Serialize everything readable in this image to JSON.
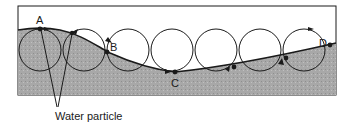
{
  "diagram": {
    "points": [
      {
        "label": "A",
        "x": 40,
        "y": 29
      },
      {
        "label": "B",
        "x": 107,
        "y": 52
      },
      {
        "label": "C",
        "x": 175,
        "y": 72
      },
      {
        "label": "D",
        "x": 330,
        "y": 45
      }
    ],
    "caption": "Water particle",
    "colors": {
      "water": "#a9a9a9",
      "stroke": "#1a1a1a",
      "background": "#ffffff"
    }
  }
}
